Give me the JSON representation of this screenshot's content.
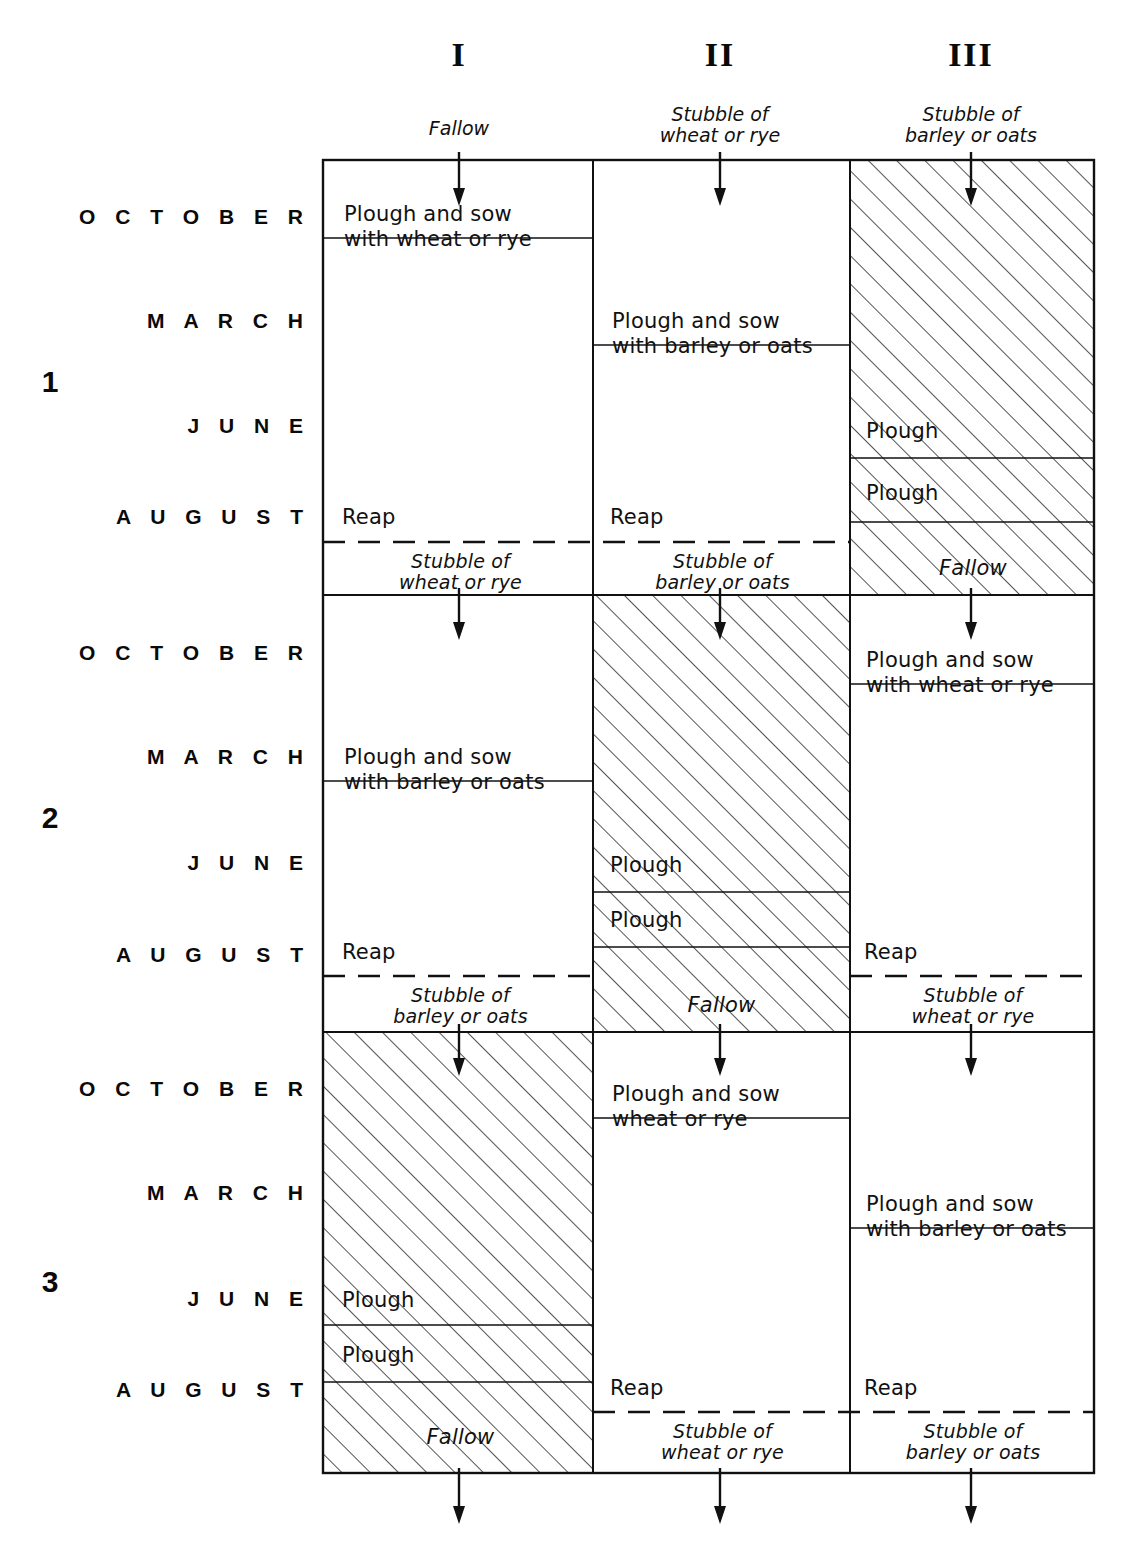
{
  "diagram": {
    "title_note": "Three-field crop rotation schedule",
    "columns": [
      {
        "numeral": "I",
        "caption": "Fallow"
      },
      {
        "numeral": "II",
        "caption": "Stubble of\nwheat or rye"
      },
      {
        "numeral": "III",
        "caption": "Stubble of\nbarley or oats"
      }
    ],
    "months": [
      "O C T O B E R",
      "M A R C H",
      "J U N E",
      "A U G U S T"
    ],
    "years": [
      "1",
      "2",
      "3"
    ],
    "labels": {
      "plough_sow_wheat_rye": "Plough and sow\nwith wheat or rye",
      "plough_sow_barley_oats": "Plough and sow\nwith barley or oats",
      "plough_sow_wheat_rye_nowith": "Plough and sow\nwheat or rye",
      "reap": "Reap",
      "plough": "Plough",
      "fallow": "Fallow",
      "stubble_wheat_rye": "Stubble of\nwheat or rye",
      "stubble_barley_oats": "Stubble of\nbarley or oats"
    },
    "cells": {
      "y1c1": {
        "action": "Plough and sow\nwith wheat or rye",
        "reap": "Reap",
        "outcome": "Stubble of\nwheat or rye",
        "hatched": false
      },
      "y1c2": {
        "action": "Plough and sow\nwith barley or oats",
        "reap": "Reap",
        "outcome": "Stubble of\nbarley or oats",
        "hatched": false
      },
      "y1c3": {
        "plough1": "Plough",
        "plough2": "Plough",
        "outcome": "Fallow",
        "hatched": true
      },
      "y2c1": {
        "action": "Plough and sow\nwith barley or oats",
        "reap": "Reap",
        "outcome": "Stubble of\nbarley or oats",
        "hatched": false
      },
      "y2c2": {
        "plough1": "Plough",
        "plough2": "Plough",
        "outcome": "Fallow",
        "hatched": true
      },
      "y2c3": {
        "action": "Plough and sow\nwith wheat or rye",
        "reap": "Reap",
        "outcome": "Stubble of\nwheat or rye",
        "hatched": false
      },
      "y3c1": {
        "plough1": "Plough",
        "plough2": "Plough",
        "outcome": "Fallow",
        "hatched": true
      },
      "y3c2": {
        "action": "Plough and sow\nwheat or rye",
        "reap": "Reap",
        "outcome": "Stubble of\nwheat or rye",
        "hatched": false
      },
      "y3c3": {
        "action": "Plough and sow\nwith barley or oats",
        "reap": "Reap",
        "outcome": "Stubble of\nbarley or oats",
        "hatched": false
      }
    },
    "colors": {
      "ink": "#111111",
      "background": "#ffffff",
      "hatch": "#2a2a2a"
    }
  }
}
